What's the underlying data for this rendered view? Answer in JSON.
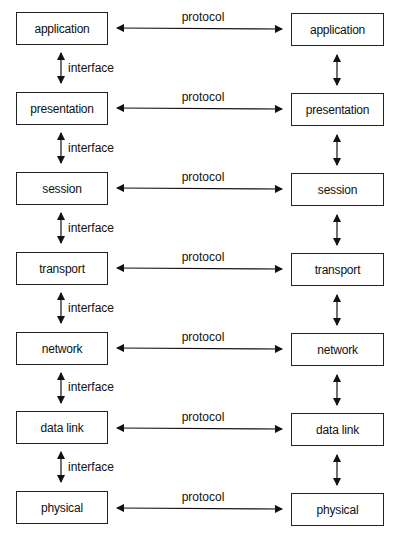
{
  "diagram": {
    "type": "layered-protocol-stack",
    "left_stack": {
      "layers": [
        {
          "label": "application"
        },
        {
          "label": "presentation"
        },
        {
          "label": "session"
        },
        {
          "label": "transport"
        },
        {
          "label": "network"
        },
        {
          "label": "data link"
        },
        {
          "label": "physical"
        }
      ]
    },
    "right_stack": {
      "layers": [
        {
          "label": "application"
        },
        {
          "label": "presentation"
        },
        {
          "label": "session"
        },
        {
          "label": "transport"
        },
        {
          "label": "network"
        },
        {
          "label": "data link"
        },
        {
          "label": "physical"
        }
      ]
    },
    "protocol_labels": [
      "protocol",
      "protocol",
      "protocol",
      "protocol",
      "protocol",
      "protocol",
      "protocol"
    ],
    "interface_labels": [
      "interface",
      "interface",
      "interface",
      "interface",
      "interface",
      "interface"
    ],
    "colors": {
      "line": "#111111",
      "box_border": "#222222",
      "background": "#ffffff"
    }
  }
}
